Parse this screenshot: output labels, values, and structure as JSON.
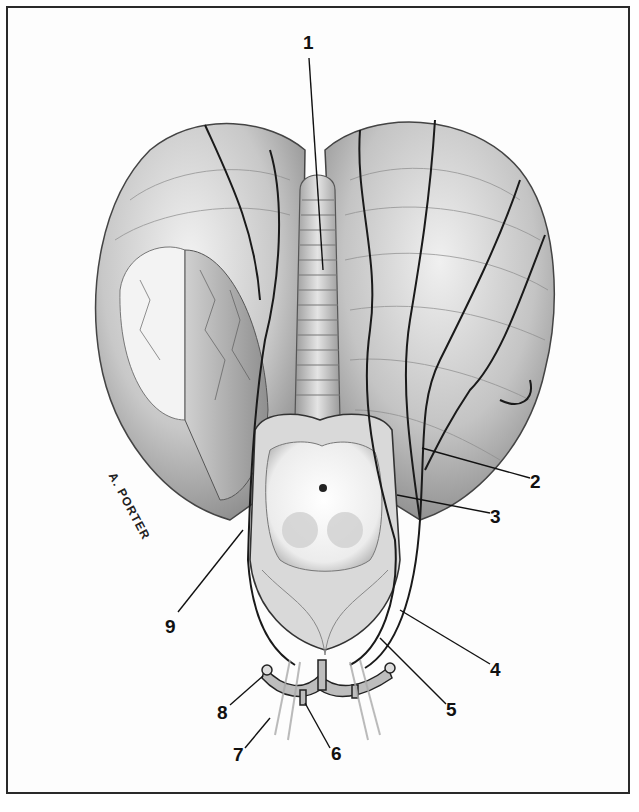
{
  "figure": {
    "signature": "A. PORTER",
    "colors": {
      "frame": "#2a2a2a",
      "tissue_light": "#e6e6e6",
      "tissue_mid": "#b9b9b9",
      "tissue_dark": "#7a7a7a",
      "vessel": "#1a1a1a"
    },
    "labels": [
      {
        "id": "1",
        "text": "1",
        "x": 303,
        "y": 33
      },
      {
        "id": "2",
        "text": "2",
        "x": 530,
        "y": 472
      },
      {
        "id": "3",
        "text": "3",
        "x": 490,
        "y": 507
      },
      {
        "id": "4",
        "text": "4",
        "x": 490,
        "y": 660
      },
      {
        "id": "5",
        "text": "5",
        "x": 446,
        "y": 700
      },
      {
        "id": "6",
        "text": "6",
        "x": 331,
        "y": 744
      },
      {
        "id": "7",
        "text": "7",
        "x": 233,
        "y": 745
      },
      {
        "id": "8",
        "text": "8",
        "x": 217,
        "y": 703
      },
      {
        "id": "9",
        "text": "9",
        "x": 165,
        "y": 617
      }
    ]
  }
}
